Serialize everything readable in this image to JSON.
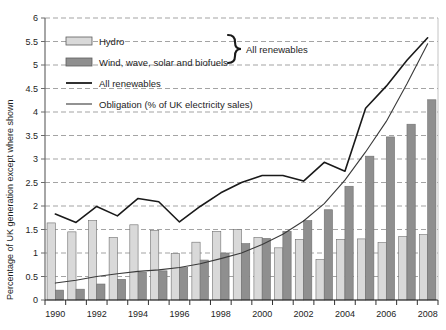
{
  "chart_data": {
    "type": "bar",
    "title": "",
    "subtitle": "",
    "xlabel": "",
    "ylabel": "Percentage of UK generation except where shown",
    "ylim": [
      0,
      6
    ],
    "ytick_step": 0.5,
    "yticks": [
      "0",
      "0.5",
      "1",
      "1.5",
      "2",
      "2.5",
      "3",
      "3.5",
      "4",
      "4.5",
      "5",
      "5.5",
      "6"
    ],
    "ytick_values": [
      0,
      0.5,
      1,
      1.5,
      2,
      2.5,
      3,
      3.5,
      4,
      4.5,
      5,
      5.5,
      6
    ],
    "grid": "horizontal-dashed",
    "legend_position": "top-left-inside",
    "categories": [
      1990,
      1991,
      1992,
      1993,
      1994,
      1995,
      1996,
      1997,
      1998,
      1999,
      2000,
      2001,
      2002,
      2003,
      2004,
      2005,
      2006,
      2007,
      2008
    ],
    "xtick_labels": [
      "1990",
      "1992",
      "1994",
      "1996",
      "1998",
      "2000",
      "2002",
      "2004",
      "2006",
      "2008"
    ],
    "xtick_label_years": [
      1990,
      1992,
      1994,
      1996,
      1998,
      2000,
      2002,
      2004,
      2006,
      2008
    ],
    "series": [
      {
        "name": "Hydro",
        "kind": "bar",
        "color": "#d9d9d9",
        "values": [
          1.64,
          1.45,
          1.69,
          1.33,
          1.6,
          1.48,
          0.99,
          1.23,
          1.46,
          1.5,
          1.33,
          1.11,
          1.29,
          0.86,
          1.29,
          1.3,
          1.22,
          1.35,
          1.39
        ]
      },
      {
        "name": "Wind, wave, solar and biofuels",
        "kind": "bar",
        "color": "#8f8f8f",
        "values": [
          0.21,
          0.23,
          0.34,
          0.44,
          0.59,
          0.62,
          0.69,
          0.85,
          1.0,
          1.2,
          1.31,
          1.46,
          1.69,
          1.92,
          2.42,
          3.06,
          3.47,
          3.74,
          4.26
        ]
      },
      {
        "name": "All renewables",
        "kind": "line",
        "color": "#1a1a1a",
        "width": 1.6,
        "values": [
          1.83,
          1.65,
          1.99,
          1.79,
          2.16,
          2.09,
          1.66,
          1.99,
          2.28,
          2.5,
          2.65,
          2.65,
          2.53,
          2.93,
          2.74,
          4.08,
          4.55,
          5.1,
          5.58
        ]
      },
      {
        "name": "Obligation (% of UK electricity sales)",
        "kind": "line",
        "color": "#3a3a3a",
        "width": 1.1,
        "values": [
          0.36,
          0.42,
          0.5,
          0.56,
          0.61,
          0.64,
          0.69,
          0.77,
          0.88,
          1.0,
          1.18,
          1.4,
          1.68,
          2.05,
          2.55,
          3.15,
          3.8,
          4.6,
          5.45
        ]
      }
    ],
    "annotations": [
      {
        "name": "all-renewables-brace",
        "text": "All renewables",
        "target": [
          "Hydro",
          "Wind, wave, solar and biofuels"
        ]
      }
    ]
  },
  "legend": {
    "items": [
      {
        "label": "Hydro",
        "marker": "swatch",
        "color": "#d9d9d9"
      },
      {
        "label": "Wind, wave, solar and biofuels",
        "marker": "swatch",
        "color": "#8f8f8f"
      },
      {
        "label": "All renewables",
        "marker": "line",
        "color": "#1a1a1a"
      },
      {
        "label": "Obligation (% of UK electricity sales)",
        "marker": "line",
        "color": "#3a3a3a"
      }
    ]
  }
}
